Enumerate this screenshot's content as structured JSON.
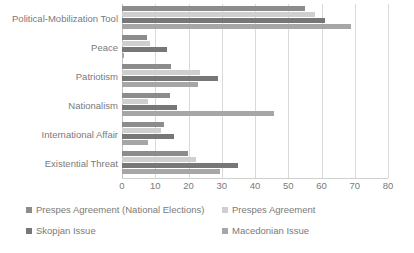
{
  "chart_data": {
    "type": "bar",
    "orientation": "horizontal",
    "title": "",
    "xlabel": "",
    "ylabel": "",
    "xlim": [
      0,
      80
    ],
    "xticks": [
      0,
      10,
      20,
      30,
      40,
      50,
      60,
      70,
      80
    ],
    "grid": true,
    "legend_position": "bottom",
    "categories": [
      "Political-Mobilization Tool",
      "Peace",
      "Patriotism",
      "Nationalism",
      "International Affair",
      "Existential Threat"
    ],
    "series": [
      {
        "name": "Prespes Agreement (National Elections)",
        "color": "#8c8c8c",
        "values": [
          55,
          7.5,
          14.7,
          14.5,
          12.6,
          19.8
        ]
      },
      {
        "name": "Prespes Agreement",
        "color": "#cfcfcf",
        "values": [
          58,
          8.5,
          23.5,
          7.8,
          11.7,
          22.3
        ]
      },
      {
        "name": "Skopjan Issue",
        "color": "#777777",
        "values": [
          61,
          13.5,
          28.8,
          16.5,
          15.6,
          34.9
        ]
      },
      {
        "name": "Macedonian Issue",
        "color": "#a6a6a6",
        "values": [
          69,
          0.5,
          22.8,
          45.7,
          7.8,
          29.5
        ]
      }
    ]
  },
  "legend": {
    "items": [
      {
        "label": "Prespes Agreement (National Elections)"
      },
      {
        "label": "Prespes Agreement"
      },
      {
        "label": "Skopjan Issue"
      },
      {
        "label": "Macedonian Issue"
      }
    ]
  },
  "axis": {
    "tick_labels": [
      "0",
      "10",
      "20",
      "30",
      "40",
      "50",
      "60",
      "70",
      "80"
    ]
  },
  "colors": {
    "series_0": "#8c8c8c",
    "series_1": "#cfcfcf",
    "series_2": "#777777",
    "series_3": "#a6a6a6",
    "gridline": "#d9d9d9",
    "text": "#7a7a7a",
    "background": "#ffffff"
  }
}
